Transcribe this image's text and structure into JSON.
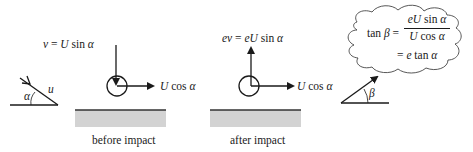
{
  "diagram": {
    "incoming": {
      "speed_label": "u",
      "angle_label": "α"
    },
    "before_impact": {
      "caption": "before impact",
      "vertical_component": {
        "lhs": "v",
        "eq": " = ",
        "rhs_var": "U",
        "rhs_fn": " sin ",
        "rhs_angle": "α"
      },
      "horizontal_component": {
        "var": "U",
        "fn": " cos ",
        "angle": "α"
      }
    },
    "after_impact": {
      "caption": "after impact",
      "vertical_component": {
        "lhs": "ev",
        "eq": " = ",
        "rhs_var": "eU",
        "rhs_fn": " sin ",
        "rhs_angle": "α"
      },
      "horizontal_component": {
        "var": "U",
        "fn": " cos ",
        "angle": "α"
      }
    },
    "outgoing": {
      "angle_label": "β"
    },
    "thought_bubble": {
      "lhs_fn": "tan ",
      "lhs_angle": "β",
      "eq": " = ",
      "numerator": {
        "var": "eU",
        "fn": " sin ",
        "angle": "α"
      },
      "denominator": {
        "var": "U",
        "fn": " cos ",
        "angle": "α"
      },
      "result": {
        "eq": "= ",
        "var": "e",
        "fn": " tan ",
        "angle": "α"
      }
    },
    "colors": {
      "stroke": "#1a1a1a",
      "ground_fill": "#d3d3d3",
      "ground_edge": "#333333"
    }
  }
}
